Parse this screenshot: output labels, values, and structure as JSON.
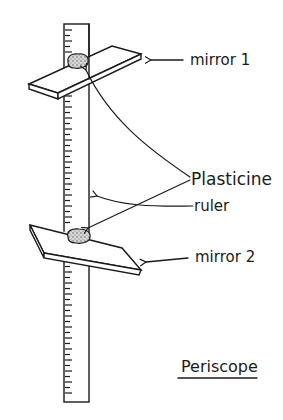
{
  "diagram": {
    "title": "Periscope",
    "labels": {
      "mirror1": "mirror 1",
      "mirror2": "mirror 2",
      "plasticine": "Plasticine",
      "ruler": "ruler"
    },
    "colors": {
      "ink": "#1a1a1a",
      "background": "#ffffff",
      "mirror_fill": "#ffffff",
      "plasticine_fill": "#cfcfcf"
    }
  }
}
